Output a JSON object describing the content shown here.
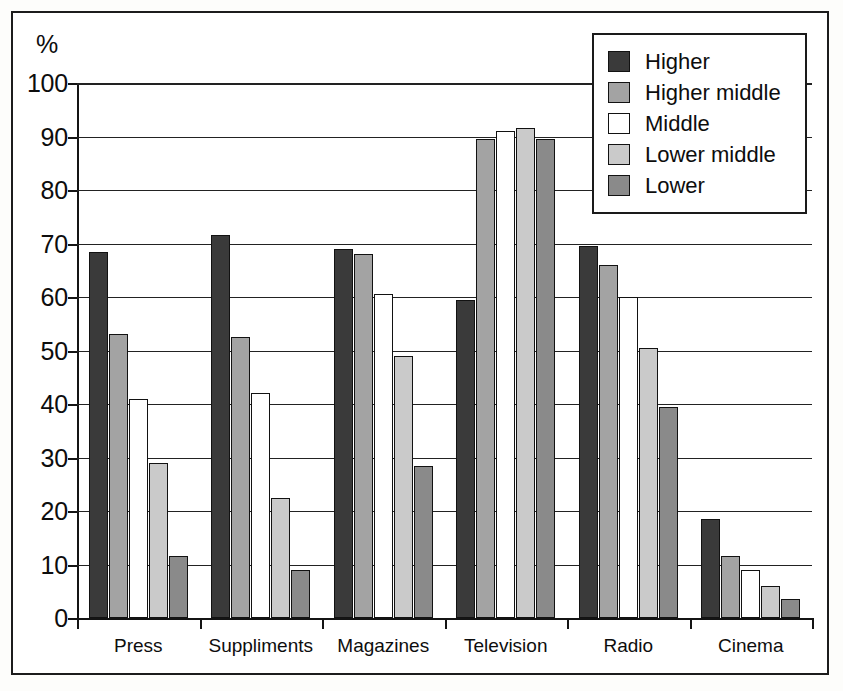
{
  "chart_data": {
    "type": "bar",
    "title": "",
    "xlabel": "",
    "ylabel": "%",
    "ylim": [
      0,
      100
    ],
    "ytick_step": 10,
    "yticks": [
      100,
      90,
      80,
      70,
      60,
      50,
      40,
      30,
      20,
      10,
      0
    ],
    "grid": true,
    "legend_position": "top-right",
    "categories": [
      "Press",
      "Suppliments",
      "Magazines",
      "Television",
      "Radio",
      "Cinema"
    ],
    "series": [
      {
        "name": "Higher",
        "color": "#3a3a3a",
        "values": [
          68.5,
          71.5,
          69.0,
          59.5,
          69.5,
          18.5
        ]
      },
      {
        "name": "Higher middle",
        "color": "#a3a3a3",
        "values": [
          53.0,
          52.5,
          68.0,
          89.5,
          66.0,
          11.5
        ]
      },
      {
        "name": "Middle",
        "color": "#ffffff",
        "values": [
          41.0,
          42.0,
          60.5,
          91.0,
          60.0,
          9.0
        ]
      },
      {
        "name": "Lower middle",
        "color": "#cacaca",
        "values": [
          29.0,
          22.5,
          49.0,
          91.5,
          50.5,
          6.0
        ]
      },
      {
        "name": "Lower",
        "color": "#8a8a8a",
        "values": [
          11.5,
          9.0,
          28.5,
          89.5,
          39.5,
          3.5
        ]
      }
    ]
  },
  "legend": {
    "items": [
      {
        "label": "Higher"
      },
      {
        "label": "Higher middle"
      },
      {
        "label": "Middle"
      },
      {
        "label": "Lower middle"
      },
      {
        "label": "Lower"
      }
    ]
  }
}
